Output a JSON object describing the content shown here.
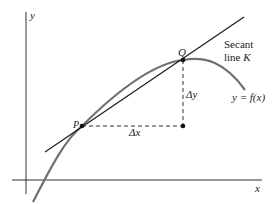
{
  "diagram": {
    "axes": {
      "x_label": "x",
      "y_label": "y"
    },
    "points": {
      "p_label": "P",
      "q_label": "Q"
    },
    "secant": {
      "line1": "Secant",
      "line2_prefix": "line ",
      "line2_var": "K"
    },
    "curve_label": "y = f(x)",
    "delta_x": "Δx",
    "delta_y": "Δy",
    "colors": {
      "curve": "#707070",
      "line": "#1a1a1a",
      "axis": "#333333"
    }
  }
}
